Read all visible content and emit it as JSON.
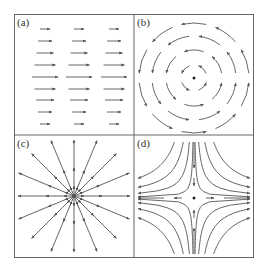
{
  "figure": {
    "stroke_color": "#555555",
    "frame_color": "#666666",
    "panels": [
      {
        "id": "a",
        "label": "(a)",
        "type": "uniform-shear-flow",
        "caption": "parallel horizontal arrows pointing right, longest in the middle row"
      },
      {
        "id": "b",
        "label": "(b)",
        "type": "vortex",
        "caption": "concentric circular counter-clockwise arrows around a center point"
      },
      {
        "id": "c",
        "label": "(c)",
        "type": "source",
        "caption": "radial arrows pointing outward from a center point"
      },
      {
        "id": "d",
        "label": "(d)",
        "type": "saddle",
        "caption": "hyperbolic flow: inflow from top and bottom, outflow to left and right"
      }
    ]
  }
}
